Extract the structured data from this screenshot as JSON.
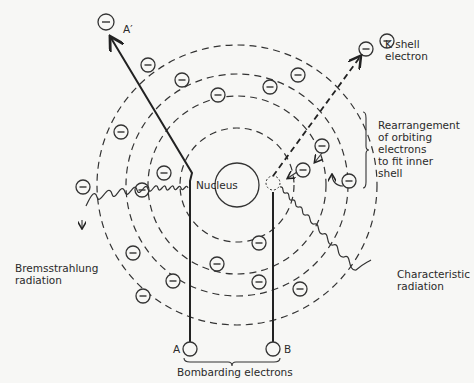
{
  "figure": {
    "nucleus_label": "Nucleus",
    "labels": {
      "a_prime": "A′",
      "k_shell": "K shell\nelectron",
      "rearrangement": "Rearrangement\nof orbiting\nelectrons\nto fit inner\nshell",
      "bremsstrahlung": "Bremsstrahlung\nradiation",
      "characteristic": "Characteristic\nradiation",
      "a": "A",
      "b": "B",
      "bombarding": "Bombarding electrons"
    },
    "electron_symbol": "−",
    "shells": [
      {
        "name": "K",
        "radius": 57
      },
      {
        "name": "L",
        "radius": 89
      },
      {
        "name": "M",
        "radius": 111
      },
      {
        "name": "N",
        "radius": 140
      }
    ]
  }
}
